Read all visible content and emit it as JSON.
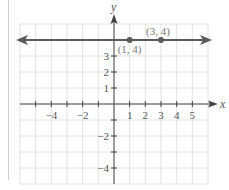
{
  "chart_data": {
    "type": "line",
    "title": "",
    "xlabel": "x",
    "ylabel": "y",
    "xlim": [
      -6,
      6
    ],
    "ylim": [
      -5,
      5
    ],
    "grid": true,
    "x_tick_labels": [
      "-4",
      "-2",
      "1",
      "2",
      "3",
      "4",
      "5"
    ],
    "x_tick_values": [
      -4,
      -2,
      1,
      2,
      3,
      4,
      5
    ],
    "y_tick_labels": [
      "3",
      "2",
      "1",
      "-2",
      "-4"
    ],
    "y_tick_values": [
      3,
      2,
      1,
      -2,
      -4
    ],
    "series": [
      {
        "name": "y = 4",
        "kind": "horizontal line with arrows",
        "x": [
          -6,
          6
        ],
        "y": [
          4,
          4
        ]
      }
    ],
    "points": [
      {
        "x": 1,
        "y": 4,
        "label": "(1, 4)"
      },
      {
        "x": 3,
        "y": 4,
        "label": "(3, 4)"
      }
    ],
    "colors": {
      "line": "#5a5a5a",
      "point": "#5a5a5a",
      "grid": "#e2e2e2",
      "axis": "#444444"
    }
  }
}
